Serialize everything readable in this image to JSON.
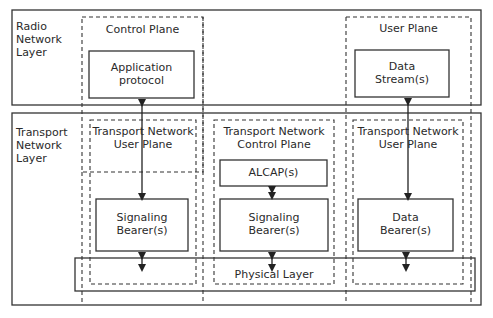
{
  "layers": {
    "radio": {
      "label": "Radio\nNetwork\nLayer"
    },
    "transport": {
      "label": "Transport\nNetwork\nLayer"
    }
  },
  "planes": {
    "control": {
      "label": "Control Plane"
    },
    "user": {
      "label": "User Plane"
    },
    "tn_user_left": {
      "label": "Transport Network\nUser Plane"
    },
    "tn_control": {
      "label": "Transport Network\nControl Plane"
    },
    "tn_user_right": {
      "label": "Transport Network\nUser Plane"
    }
  },
  "boxes": {
    "application_protocol": "Application\nprotocol",
    "data_streams": "Data\nStream(s)",
    "alcap": "ALCAP(s)",
    "signaling_bearer_left": "Signaling\nBearer(s)",
    "signaling_bearer_mid": "Signaling\nBearer(s)",
    "data_bearer": "Data\nBearer(s)",
    "physical_layer": "Physical Layer"
  },
  "colors": {
    "line": "#333333",
    "background": "#ffffff"
  }
}
